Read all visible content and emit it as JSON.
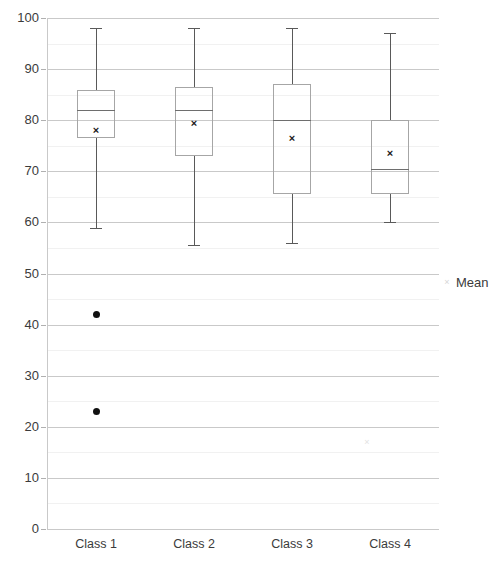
{
  "chart_data": {
    "type": "box",
    "title": "",
    "xlabel": "",
    "ylabel": "",
    "ylim": [
      0,
      100
    ],
    "ytick_step": 10,
    "minor_grid_step": 5,
    "grid": true,
    "legend_position": "right",
    "categories": [
      "Class 1",
      "Class 2",
      "Class 3",
      "Class 4"
    ],
    "yticks": [
      "100",
      "90",
      "80",
      "70",
      "60",
      "50",
      "40",
      "30",
      "20",
      "10",
      "0"
    ],
    "legend": [
      {
        "label": "Mean",
        "marker": "x-marker"
      }
    ],
    "boxes": [
      {
        "category": "Class 1",
        "whisker_low": 59,
        "q1": 76.5,
        "median": 82,
        "q3": 86,
        "whisker_high": 98,
        "mean": 78,
        "outliers": [
          42,
          23
        ]
      },
      {
        "category": "Class 2",
        "whisker_low": 55.5,
        "q1": 73,
        "median": 82,
        "q3": 86.5,
        "whisker_high": 98,
        "mean": 79.5,
        "outliers": []
      },
      {
        "category": "Class 3",
        "whisker_low": 56,
        "q1": 65.5,
        "median": 80,
        "q3": 87,
        "whisker_high": 98,
        "mean": 76.5,
        "outliers": []
      },
      {
        "category": "Class 4",
        "whisker_low": 60,
        "q1": 65.5,
        "median": 70.5,
        "q3": 80,
        "whisker_high": 97,
        "mean": 73.5,
        "outliers": []
      }
    ],
    "faint_markers": [
      {
        "value": 17,
        "near_category": "Class 3"
      }
    ],
    "colors": {
      "box_border": "#a6a6a6",
      "whisker": "#595959",
      "median": "#6e6e6e",
      "mean_marker": "#1a1a1a",
      "outlier": "#111111",
      "gridline_major": "#c9c9c9",
      "gridline_minor": "#f1f1f1",
      "text": "#3b3b3b",
      "background": "#ffffff"
    }
  }
}
